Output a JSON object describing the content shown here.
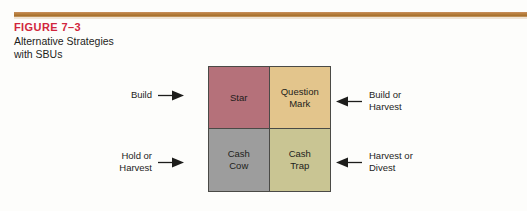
{
  "caption": {
    "figure_number": "FIGURE 7–3",
    "title_line_1": "Alternative Strategies",
    "title_line_2": "with SBUs"
  },
  "colors": {
    "figure_number": "#d1253c",
    "rule": "#b9803f",
    "star": "#b5717a",
    "question_mark": "#e3c58c",
    "cash_cow": "#9d9d9d",
    "cash_trap": "#c9c593",
    "border": "#4a4a46",
    "page_background": "#fdfdfb"
  },
  "matrix": {
    "cells": [
      {
        "id": "star",
        "label": "Star",
        "label_line_2": ""
      },
      {
        "id": "question-mark",
        "label": "Question",
        "label_line_2": "Mark"
      },
      {
        "id": "cash-cow",
        "label": "Cash",
        "label_line_2": "Cow"
      },
      {
        "id": "cash-trap",
        "label": "Cash",
        "label_line_2": "Trap"
      }
    ]
  },
  "callouts": [
    {
      "id": "build",
      "line_1": "Build",
      "line_2": "",
      "arrow": "arrow-right-icon",
      "side": "left",
      "points_to": "star"
    },
    {
      "id": "hold-or-harvest",
      "line_1": "Hold or",
      "line_2": "Harvest",
      "arrow": "arrow-right-icon",
      "side": "left",
      "points_to": "cash-cow"
    },
    {
      "id": "build-or-harvest",
      "line_1": "Build or",
      "line_2": "Harvest",
      "arrow": "arrow-left-icon",
      "side": "right",
      "points_to": "question-mark"
    },
    {
      "id": "harvest-or-divest",
      "line_1": "Harvest or",
      "line_2": "Divest",
      "arrow": "arrow-left-icon",
      "side": "right",
      "points_to": "cash-trap"
    }
  ]
}
